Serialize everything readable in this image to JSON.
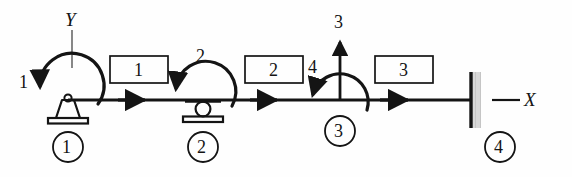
{
  "figure": {
    "type": "structural-beam-dof-diagram",
    "background_color": "#fefefe",
    "ink_color": "#141414"
  },
  "axes": {
    "y_label": "Y",
    "x_label": "X"
  },
  "dof_labels": [
    {
      "id": "dof-1",
      "text": "1",
      "kind": "rotation",
      "at_node": 1
    },
    {
      "id": "dof-2",
      "text": "2",
      "kind": "rotation",
      "at_node": 2
    },
    {
      "id": "dof-3",
      "text": "3",
      "kind": "translation",
      "at_node": 3
    },
    {
      "id": "dof-4",
      "text": "4",
      "kind": "rotation",
      "at_node": 3
    }
  ],
  "elements": [
    {
      "id": "element-1",
      "label": "1"
    },
    {
      "id": "element-2",
      "label": "2"
    },
    {
      "id": "element-3",
      "label": "3"
    }
  ],
  "nodes": [
    {
      "id": "node-1",
      "label": "1",
      "support": "pin"
    },
    {
      "id": "node-2",
      "label": "2",
      "support": "roller"
    },
    {
      "id": "node-3",
      "label": "3",
      "support": "free"
    },
    {
      "id": "node-4",
      "label": "4",
      "support": "fixed"
    }
  ]
}
